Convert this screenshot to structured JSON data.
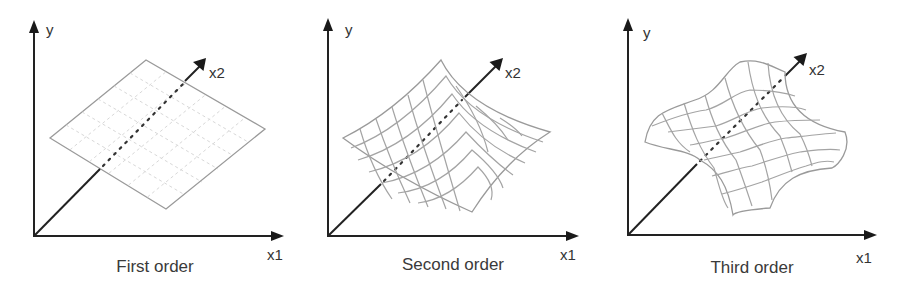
{
  "figure": {
    "panels": [
      {
        "id": "first",
        "caption": "First order",
        "axis_labels": {
          "y": "y",
          "x1": "x1",
          "x2": "x2"
        },
        "surface": "flat plane"
      },
      {
        "id": "second",
        "caption": "Second order",
        "axis_labels": {
          "y": "y",
          "x1": "x1",
          "x2": "x2"
        },
        "surface": "curved (quadratic) saddle-like bowl"
      },
      {
        "id": "third",
        "caption": "Third order",
        "axis_labels": {
          "y": "y",
          "x1": "x1",
          "x2": "x2"
        },
        "surface": "wavy (cubic) surface"
      }
    ],
    "colors": {
      "axis": "#222222",
      "surface_line": "#a0a0a0",
      "plane_grid": "#d8d8d8",
      "text": "#333333",
      "background": "#ffffff"
    }
  }
}
